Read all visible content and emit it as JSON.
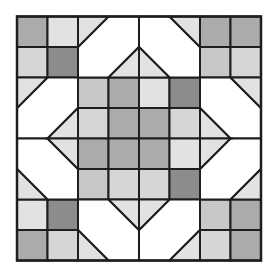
{
  "canvas": {
    "width": 277,
    "height": 278
  },
  "block": {
    "x0": 17,
    "y0": 16.5,
    "cell": 30.5,
    "grid": 8,
    "line_color": "#1e1e1e",
    "line_width": 2
  },
  "colors": {
    "white": "#ffffff",
    "pale": "#e2e2e2",
    "light": "#d6d6d6",
    "lightmid": "#c8c8c8",
    "mid": "#ababab",
    "dark": "#8c8c8c"
  },
  "squares": [
    {
      "r": 0,
      "c": 0,
      "fill": "mid"
    },
    {
      "r": 0,
      "c": 1,
      "fill": "pale"
    },
    {
      "r": 1,
      "c": 0,
      "fill": "light"
    },
    {
      "r": 1,
      "c": 1,
      "fill": "dark"
    },
    {
      "r": 0,
      "c": 6,
      "fill": "mid"
    },
    {
      "r": 0,
      "c": 7,
      "fill": "mid"
    },
    {
      "r": 1,
      "c": 6,
      "fill": "lightmid"
    },
    {
      "r": 1,
      "c": 7,
      "fill": "light"
    },
    {
      "r": 6,
      "c": 0,
      "fill": "pale"
    },
    {
      "r": 6,
      "c": 1,
      "fill": "dark"
    },
    {
      "r": 7,
      "c": 0,
      "fill": "mid"
    },
    {
      "r": 7,
      "c": 1,
      "fill": "light"
    },
    {
      "r": 6,
      "c": 6,
      "fill": "lightmid"
    },
    {
      "r": 6,
      "c": 7,
      "fill": "mid"
    },
    {
      "r": 7,
      "c": 6,
      "fill": "light"
    },
    {
      "r": 7,
      "c": 7,
      "fill": "mid"
    },
    {
      "r": 2,
      "c": 2,
      "fill": "lightmid"
    },
    {
      "r": 2,
      "c": 3,
      "fill": "mid"
    },
    {
      "r": 2,
      "c": 4,
      "fill": "pale"
    },
    {
      "r": 2,
      "c": 5,
      "fill": "dark"
    },
    {
      "r": 3,
      "c": 2,
      "fill": "light"
    },
    {
      "r": 3,
      "c": 3,
      "fill": "mid"
    },
    {
      "r": 3,
      "c": 4,
      "fill": "mid"
    },
    {
      "r": 3,
      "c": 5,
      "fill": "light"
    },
    {
      "r": 4,
      "c": 2,
      "fill": "mid"
    },
    {
      "r": 4,
      "c": 3,
      "fill": "mid"
    },
    {
      "r": 4,
      "c": 4,
      "fill": "mid"
    },
    {
      "r": 4,
      "c": 5,
      "fill": "pale"
    },
    {
      "r": 5,
      "c": 2,
      "fill": "lightmid"
    },
    {
      "r": 5,
      "c": 3,
      "fill": "light"
    },
    {
      "r": 5,
      "c": 4,
      "fill": "light"
    },
    {
      "r": 5,
      "c": 5,
      "fill": "dark"
    }
  ],
  "polygons": [
    {
      "name": "top-white-left",
      "fill": "white",
      "pts": [
        [
          3,
          0
        ],
        [
          4,
          0
        ],
        [
          4,
          1
        ],
        [
          3,
          2
        ],
        [
          2,
          2
        ],
        [
          2,
          1
        ]
      ]
    },
    {
      "name": "top-white-right",
      "fill": "white",
      "pts": [
        [
          4,
          0
        ],
        [
          5,
          0
        ],
        [
          6,
          1
        ],
        [
          6,
          2
        ],
        [
          5,
          2
        ],
        [
          4,
          1
        ]
      ]
    },
    {
      "name": "top-tri-left",
      "fill": "pale",
      "pts": [
        [
          2,
          0
        ],
        [
          3,
          0
        ],
        [
          2,
          1
        ]
      ]
    },
    {
      "name": "top-tri-right",
      "fill": "pale",
      "pts": [
        [
          5,
          0
        ],
        [
          6,
          0
        ],
        [
          6,
          1
        ]
      ]
    },
    {
      "name": "top-center-left",
      "fill": "pale",
      "pts": [
        [
          3,
          2
        ],
        [
          4,
          1
        ],
        [
          4,
          2
        ]
      ]
    },
    {
      "name": "top-center-right",
      "fill": "pale",
      "pts": [
        [
          4,
          1
        ],
        [
          5,
          2
        ],
        [
          4,
          2
        ]
      ]
    },
    {
      "name": "bottom-white-left",
      "fill": "white",
      "pts": [
        [
          2,
          6
        ],
        [
          3,
          6
        ],
        [
          4,
          7
        ],
        [
          4,
          8
        ],
        [
          3,
          8
        ],
        [
          2,
          7
        ]
      ]
    },
    {
      "name": "bottom-white-right",
      "fill": "white",
      "pts": [
        [
          5,
          6
        ],
        [
          6,
          6
        ],
        [
          6,
          7
        ],
        [
          5,
          8
        ],
        [
          4,
          8
        ],
        [
          4,
          7
        ]
      ]
    },
    {
      "name": "bottom-tri-left",
      "fill": "pale",
      "pts": [
        [
          2,
          7
        ],
        [
          3,
          8
        ],
        [
          2,
          8
        ]
      ]
    },
    {
      "name": "bottom-tri-right",
      "fill": "pale",
      "pts": [
        [
          6,
          7
        ],
        [
          6,
          8
        ],
        [
          5,
          8
        ]
      ]
    },
    {
      "name": "bottom-center-left",
      "fill": "pale",
      "pts": [
        [
          3,
          6
        ],
        [
          4,
          6
        ],
        [
          4,
          7
        ]
      ]
    },
    {
      "name": "bottom-center-right",
      "fill": "pale",
      "pts": [
        [
          4,
          6
        ],
        [
          5,
          6
        ],
        [
          4,
          7
        ]
      ]
    },
    {
      "name": "left-white-top",
      "fill": "white",
      "pts": [
        [
          0,
          3
        ],
        [
          1,
          2
        ],
        [
          2,
          2
        ],
        [
          2,
          3
        ],
        [
          1,
          4
        ],
        [
          0,
          4
        ]
      ]
    },
    {
      "name": "left-white-bottom",
      "fill": "white",
      "pts": [
        [
          0,
          4
        ],
        [
          1,
          4
        ],
        [
          2,
          5
        ],
        [
          2,
          6
        ],
        [
          1,
          6
        ],
        [
          0,
          5
        ]
      ]
    },
    {
      "name": "left-tri-top",
      "fill": "pale",
      "pts": [
        [
          0,
          2
        ],
        [
          1,
          2
        ],
        [
          0,
          3
        ]
      ]
    },
    {
      "name": "left-tri-bottom",
      "fill": "pale",
      "pts": [
        [
          0,
          5
        ],
        [
          1,
          6
        ],
        [
          0,
          6
        ]
      ]
    },
    {
      "name": "left-center-top",
      "fill": "pale",
      "pts": [
        [
          2,
          3
        ],
        [
          2,
          4
        ],
        [
          1,
          4
        ]
      ]
    },
    {
      "name": "left-center-bottom",
      "fill": "pale",
      "pts": [
        [
          1,
          4
        ],
        [
          2,
          4
        ],
        [
          2,
          5
        ]
      ]
    },
    {
      "name": "right-white-top",
      "fill": "white",
      "pts": [
        [
          6,
          2
        ],
        [
          7,
          2
        ],
        [
          8,
          3
        ],
        [
          8,
          4
        ],
        [
          7,
          4
        ],
        [
          6,
          3
        ]
      ]
    },
    {
      "name": "right-white-bottom",
      "fill": "white",
      "pts": [
        [
          7,
          4
        ],
        [
          8,
          4
        ],
        [
          8,
          5
        ],
        [
          7,
          6
        ],
        [
          6,
          6
        ],
        [
          6,
          5
        ]
      ]
    },
    {
      "name": "right-tri-top",
      "fill": "pale",
      "pts": [
        [
          7,
          2
        ],
        [
          8,
          2
        ],
        [
          8,
          3
        ]
      ]
    },
    {
      "name": "right-tri-bottom",
      "fill": "pale",
      "pts": [
        [
          8,
          5
        ],
        [
          8,
          6
        ],
        [
          7,
          6
        ]
      ]
    },
    {
      "name": "right-center-top",
      "fill": "pale",
      "pts": [
        [
          6,
          3
        ],
        [
          7,
          4
        ],
        [
          6,
          4
        ]
      ]
    },
    {
      "name": "right-center-bottom",
      "fill": "pale",
      "pts": [
        [
          6,
          4
        ],
        [
          7,
          4
        ],
        [
          6,
          5
        ]
      ]
    }
  ]
}
